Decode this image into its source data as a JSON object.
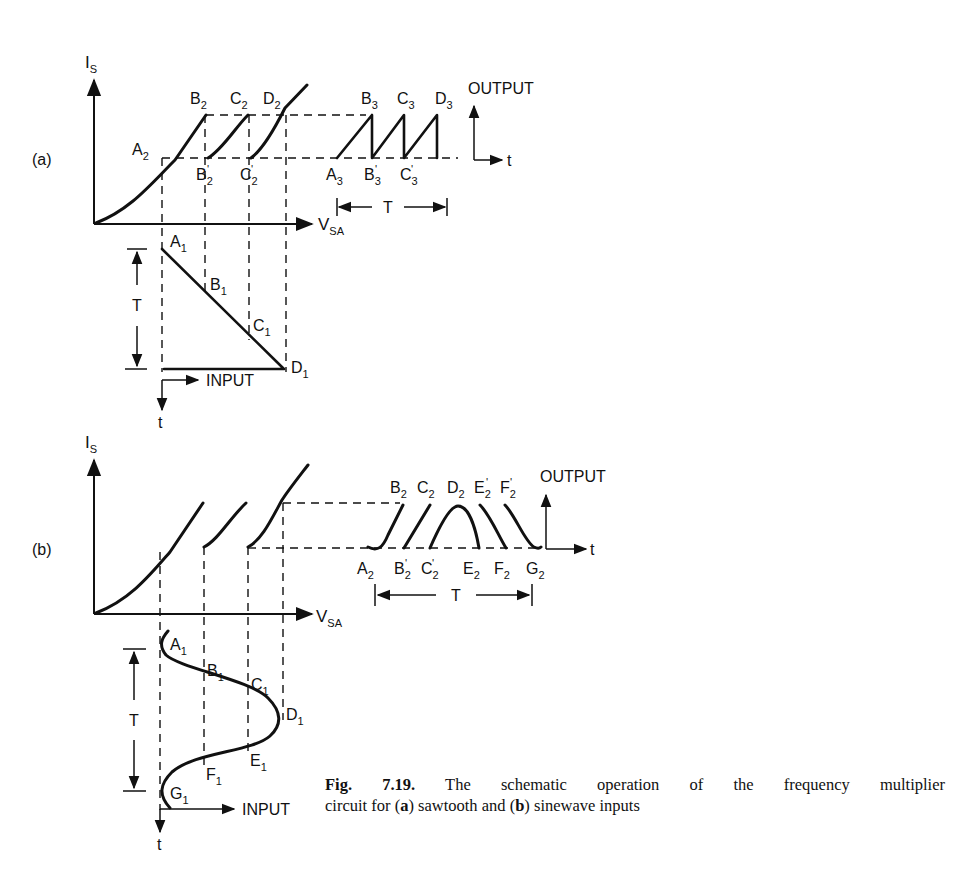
{
  "figure": {
    "number": "Fig. 7.19.",
    "caption_line1": "The schematic operation of the frequency multiplier",
    "caption_line2_prefix": "circuit for (",
    "caption_a": "a",
    "caption_mid": ") sawtooth and (",
    "caption_b": "b",
    "caption_suffix": ") sinewave inputs"
  },
  "panel_a": {
    "label": "(a)",
    "y_axis": {
      "main": "I",
      "sub": "S"
    },
    "x_axis": {
      "main": "V",
      "sub": "SA"
    },
    "transfer_points": [
      {
        "main": "A",
        "sub": "2"
      },
      {
        "main": "B",
        "sub": "2"
      },
      {
        "main": "C",
        "sub": "2"
      },
      {
        "main": "D",
        "sub": "2"
      },
      {
        "main": "B",
        "sub": "2",
        "prime": true
      },
      {
        "main": "C",
        "sub": "2",
        "prime": true
      }
    ],
    "output_points_top": [
      {
        "main": "B",
        "sub": "3"
      },
      {
        "main": "C",
        "sub": "3"
      },
      {
        "main": "D",
        "sub": "3"
      }
    ],
    "output_points_bottom": [
      {
        "main": "A",
        "sub": "3"
      },
      {
        "main": "B",
        "sub": "3",
        "prime": true
      },
      {
        "main": "C",
        "sub": "3",
        "prime": true
      }
    ],
    "output_label": "OUTPUT",
    "output_t": "t",
    "period_label": "T",
    "input_points": [
      {
        "main": "A",
        "sub": "1"
      },
      {
        "main": "B",
        "sub": "1"
      },
      {
        "main": "C",
        "sub": "1"
      },
      {
        "main": "D",
        "sub": "1"
      }
    ],
    "input_label": "INPUT",
    "input_t": "t",
    "input_period": "T"
  },
  "panel_b": {
    "label": "(b)",
    "y_axis": {
      "main": "I",
      "sub": "S"
    },
    "x_axis": {
      "main": "V",
      "sub": "SA"
    },
    "output_points_top": [
      {
        "main": "B",
        "sub": "2"
      },
      {
        "main": "C",
        "sub": "2"
      },
      {
        "main": "D",
        "sub": "2"
      },
      {
        "main": "E",
        "sub": "2",
        "prime": true
      },
      {
        "main": "F",
        "sub": "2",
        "prime": true
      }
    ],
    "output_points_bottom": [
      {
        "main": "A",
        "sub": "2"
      },
      {
        "main": "B",
        "sub": "2",
        "prime": true
      },
      {
        "main": "C",
        "sub": "2",
        "prime": true
      },
      {
        "main": "E",
        "sub": "2"
      },
      {
        "main": "F",
        "sub": "2"
      },
      {
        "main": "G",
        "sub": "2"
      }
    ],
    "output_label": "OUTPUT",
    "output_t": "t",
    "period_label": "T",
    "input_points": [
      {
        "main": "A",
        "sub": "1"
      },
      {
        "main": "B",
        "sub": "1"
      },
      {
        "main": "C",
        "sub": "1"
      },
      {
        "main": "D",
        "sub": "1"
      },
      {
        "main": "E",
        "sub": "1"
      },
      {
        "main": "F",
        "sub": "1"
      },
      {
        "main": "G",
        "sub": "1"
      }
    ],
    "input_label": "INPUT",
    "input_t": "t",
    "input_period": "T"
  }
}
